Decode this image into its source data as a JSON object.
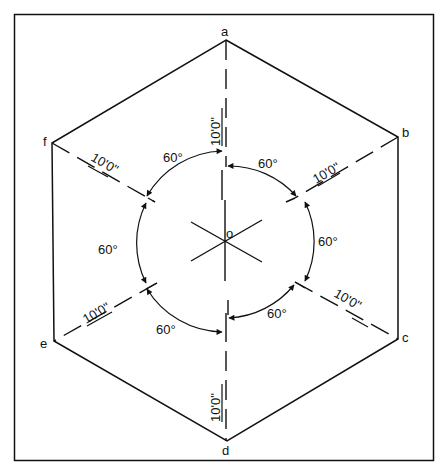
{
  "diagram": {
    "center_label": "o",
    "vertices": [
      {
        "id": "a",
        "label": "a"
      },
      {
        "id": "b",
        "label": "b"
      },
      {
        "id": "c",
        "label": "c"
      },
      {
        "id": "d",
        "label": "d"
      },
      {
        "id": "e",
        "label": "e"
      },
      {
        "id": "f",
        "label": "f"
      }
    ],
    "radius_labels": [
      "10'0\"",
      "10'0\"",
      "10'0\"",
      "10'0\"",
      "10'0\"",
      "10'0\""
    ],
    "angle_labels": [
      "60°",
      "60°",
      "60°",
      "60°",
      "60°",
      "60°"
    ]
  }
}
